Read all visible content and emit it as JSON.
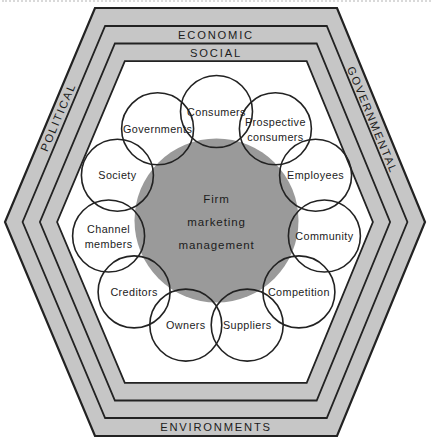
{
  "colors": {
    "band_fill": "#c6c6c6",
    "interior_fill": "#ffffff",
    "core_fill": "#9a9a9a",
    "outline": "#222222",
    "label_text": "#1c1c1c"
  },
  "environment_labels": [
    {
      "id": "economic",
      "text": "ECONOMIC"
    },
    {
      "id": "social",
      "text": "SOCIAL"
    },
    {
      "id": "political",
      "text": "POLITICAL"
    },
    {
      "id": "governmental",
      "text": "GOVERNMENTAL"
    },
    {
      "id": "environments",
      "text": "ENVIRONMENTS"
    }
  ],
  "core_circle": {
    "lines": [
      "Firm",
      "marketing",
      "management"
    ]
  },
  "stakeholder_circles": [
    {
      "id": "consumers",
      "lines": [
        "Consumers"
      ]
    },
    {
      "id": "prospective-consumers",
      "lines": [
        "Prospective",
        "consumers"
      ]
    },
    {
      "id": "employees",
      "lines": [
        "Employees"
      ]
    },
    {
      "id": "community",
      "lines": [
        "Community"
      ]
    },
    {
      "id": "competition",
      "lines": [
        "Competition"
      ]
    },
    {
      "id": "suppliers",
      "lines": [
        "Suppliers"
      ]
    },
    {
      "id": "owners",
      "lines": [
        "Owners"
      ]
    },
    {
      "id": "creditors",
      "lines": [
        "Creditors"
      ]
    },
    {
      "id": "channel-members",
      "lines": [
        "Channel",
        "members"
      ]
    },
    {
      "id": "society",
      "lines": [
        "Society"
      ]
    },
    {
      "id": "governments",
      "lines": [
        "Governments"
      ]
    }
  ]
}
